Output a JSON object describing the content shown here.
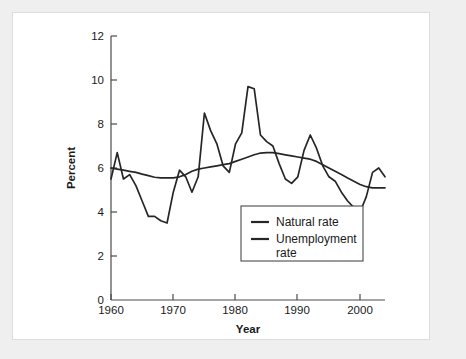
{
  "figure": {
    "background_color": "#efefef",
    "card_color": "#ffffff",
    "border_color": "#dcdcdc",
    "line_color": "#262626",
    "axis_color": "#4a4a4a"
  },
  "chart_data": {
    "type": "line",
    "title": "",
    "subtitle": "",
    "xlabel": "Year",
    "ylabel": "Percent",
    "xlim": [
      1960,
      2004
    ],
    "ylim": [
      0,
      12
    ],
    "xticks": [
      1960,
      1970,
      1980,
      1990,
      2000
    ],
    "xtick_labels": [
      "1960",
      "1970",
      "1980",
      "1990",
      "2000"
    ],
    "yticks": [
      0,
      2,
      4,
      6,
      8,
      10,
      12
    ],
    "ytick_labels": [
      "0",
      "2",
      "4",
      "6",
      "8",
      "10",
      "12"
    ],
    "grid": false,
    "legend_position": "inside-bottom-center",
    "x": [
      1960,
      1961,
      1962,
      1963,
      1964,
      1965,
      1966,
      1967,
      1968,
      1969,
      1970,
      1971,
      1972,
      1973,
      1974,
      1975,
      1976,
      1977,
      1978,
      1979,
      1980,
      1981,
      1982,
      1983,
      1984,
      1985,
      1986,
      1987,
      1988,
      1989,
      1990,
      1991,
      1992,
      1993,
      1994,
      1995,
      1996,
      1997,
      1998,
      1999,
      2000,
      2001,
      2002,
      2003,
      2004
    ],
    "series": [
      {
        "name": "Natural rate",
        "color": "#262626",
        "values": [
          6.0,
          5.95,
          5.9,
          5.85,
          5.8,
          5.72,
          5.65,
          5.58,
          5.55,
          5.55,
          5.55,
          5.6,
          5.7,
          5.85,
          5.95,
          6.0,
          6.05,
          6.1,
          6.15,
          6.2,
          6.3,
          6.4,
          6.5,
          6.6,
          6.68,
          6.7,
          6.7,
          6.65,
          6.6,
          6.55,
          6.5,
          6.45,
          6.4,
          6.3,
          6.15,
          6.0,
          5.85,
          5.7,
          5.55,
          5.4,
          5.25,
          5.15,
          5.1,
          5.1,
          5.1
        ]
      },
      {
        "name": "Unemployment rate",
        "color": "#262626",
        "values": [
          5.5,
          6.7,
          5.5,
          5.7,
          5.2,
          4.5,
          3.8,
          3.8,
          3.6,
          3.5,
          4.9,
          5.9,
          5.6,
          4.9,
          5.6,
          8.5,
          7.7,
          7.1,
          6.1,
          5.8,
          7.1,
          7.6,
          9.7,
          9.6,
          7.5,
          7.2,
          7.0,
          6.2,
          5.5,
          5.3,
          5.6,
          6.8,
          7.5,
          6.9,
          6.1,
          5.6,
          5.4,
          4.9,
          4.5,
          4.2,
          4.0,
          4.7,
          5.8,
          6.0,
          5.6
        ]
      }
    ]
  },
  "legend": {
    "entries": [
      {
        "label": "Natural rate"
      },
      {
        "label": "Unemployment",
        "label_line2": "rate"
      }
    ]
  }
}
